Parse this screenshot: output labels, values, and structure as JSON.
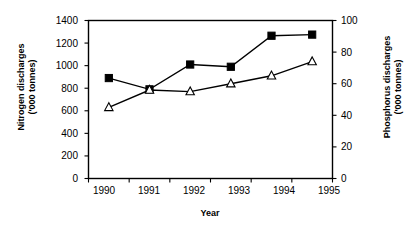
{
  "chart_data": {
    "type": "line",
    "title": "",
    "xlabel": "Year",
    "categories": [
      "1990",
      "1991",
      "1992",
      "1993",
      "1994",
      "1995"
    ],
    "x": [
      1990,
      1991,
      1992,
      1993,
      1994,
      1995
    ],
    "grid": false,
    "legend": "none",
    "series": [
      {
        "name": "Nitrogen discharges",
        "marker": "filled-square",
        "axis": "left",
        "values": [
          890,
          790,
          1010,
          990,
          1265,
          1275
        ]
      },
      {
        "name": "Phosphorus discharges",
        "marker": "open-triangle",
        "axis": "right",
        "values": [
          45,
          56,
          55,
          60,
          65,
          74
        ]
      }
    ],
    "axes": {
      "left": {
        "label_line1": "Nitrogen discharges",
        "label_line2": "('000 tonnes)",
        "ylim": [
          0,
          1400
        ],
        "ticks": [
          0,
          200,
          400,
          600,
          800,
          1000,
          1200,
          1400
        ],
        "tick_labels": [
          "0",
          "200",
          "400",
          "600",
          "800",
          "1000",
          "1200",
          "1400"
        ]
      },
      "right": {
        "label_line1": "Phosphorus discharges",
        "label_line2": "('000 tonnes)",
        "ylim": [
          0,
          100
        ],
        "ticks": [
          0,
          20,
          40,
          60,
          80,
          100
        ],
        "tick_labels": [
          "0",
          "20",
          "40",
          "60",
          "80",
          "100"
        ]
      },
      "x": {
        "label": "Year",
        "tick_labels": [
          "1990",
          "1991",
          "1992",
          "1993",
          "1994",
          "1995"
        ]
      }
    },
    "colors": {
      "line": "#000000",
      "marker_fill_series1": "#000000",
      "marker_fill_series2": "#ffffff",
      "axis": "#000000",
      "background": "#ffffff"
    }
  }
}
